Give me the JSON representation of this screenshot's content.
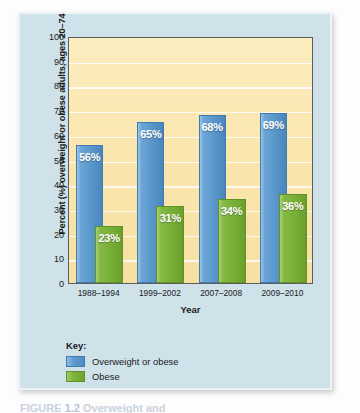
{
  "figure": {
    "caption_prefix": "FIGURE",
    "caption_number": "1.2",
    "caption_rest": "Overweight and"
  },
  "chart_data": {
    "type": "bar",
    "title": "",
    "xlabel": "Year",
    "ylabel": "Percent (%) overweight or obese adults, ages 20–74",
    "ylim": [
      0,
      100
    ],
    "ytick_step": 10,
    "grid": true,
    "legend_position": "below-left",
    "legend_title": "Key:",
    "categories": [
      "1988–1994",
      "1999–2002",
      "2007–2008",
      "2009–2010"
    ],
    "series": [
      {
        "name": "Overweight or obese",
        "color": "#5694c9",
        "values": [
          56,
          65,
          68,
          69
        ],
        "labels": [
          "56%",
          "65%",
          "68%",
          "69%"
        ]
      },
      {
        "name": "Obese",
        "color": "#76ad34",
        "values": [
          23,
          31,
          34,
          36
        ],
        "labels": [
          "23%",
          "31%",
          "34%",
          "36%"
        ]
      }
    ],
    "ytick_labels": [
      "100",
      "90",
      "80",
      "70",
      "60",
      "50",
      "40",
      "30",
      "20",
      "10",
      "0"
    ]
  },
  "colors": {
    "card_background": "#cfe2ea",
    "plot_background": "#fae6ae",
    "gridline": "#ffffff",
    "blue": "#5694c9",
    "green": "#76ad34",
    "axis_border": "#5c5c60",
    "text": "#1a1a1a"
  }
}
